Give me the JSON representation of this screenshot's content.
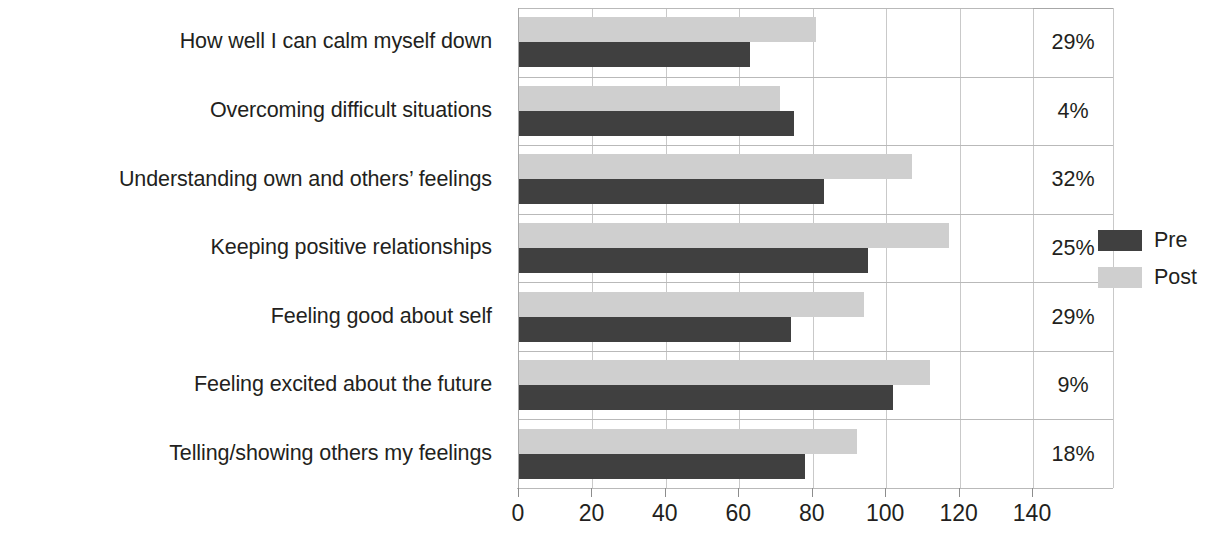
{
  "chart_data": {
    "type": "bar",
    "orientation": "horizontal",
    "title": "",
    "xlabel": "",
    "ylabel": "",
    "xlim": [
      0,
      140
    ],
    "grid": true,
    "legend_position": "right",
    "categories": [
      "How well I can calm myself down",
      "Overcoming difficult situations",
      "Understanding own and others’ feelings",
      "Keeping positive relationships",
      "Feeling good about self",
      "Feeling excited about the future",
      "Telling/showing others my feelings"
    ],
    "series": [
      {
        "name": "Pre",
        "color": "#404040",
        "values": [
          63,
          75,
          83,
          95,
          74,
          102,
          78
        ]
      },
      {
        "name": "Post",
        "color": "#cfcfcf",
        "values": [
          81,
          71,
          107,
          117,
          94,
          112,
          92
        ]
      }
    ],
    "annotations": {
      "label": "percent change",
      "values": [
        "29%",
        "4%",
        "32%",
        "25%",
        "29%",
        "9%",
        "18%"
      ]
    },
    "xticks": [
      0,
      20,
      40,
      60,
      80,
      100,
      120,
      140
    ],
    "xtick_labels": [
      "0",
      "20",
      "40",
      "60",
      "80",
      "100",
      "120",
      "140"
    ]
  },
  "legend": {
    "items": [
      {
        "label": "Pre",
        "swatch": "dark-gray-swatch"
      },
      {
        "label": "Post",
        "swatch": "light-gray-swatch"
      }
    ]
  },
  "colors": {
    "pre": "#404040",
    "post": "#cfcfcf",
    "text": "#231f20",
    "gridline": "#c9c9c9",
    "axis": "#b9b9b9",
    "background": "#ffffff"
  }
}
